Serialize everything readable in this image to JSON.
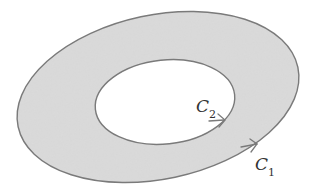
{
  "diagram": {
    "type": "annular region between two closed curves",
    "region_fill": "#d6d6d6",
    "stroke_color": "#7a7a7a",
    "curves": [
      {
        "name": "C",
        "subscript": "1",
        "role": "outer boundary",
        "orientation": "counterclockwise arrow shown lower-right"
      },
      {
        "name": "C",
        "subscript": "2",
        "role": "inner boundary",
        "orientation": "arrow shown lower-right"
      }
    ]
  }
}
